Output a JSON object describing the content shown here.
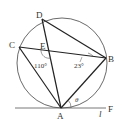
{
  "diagram": {
    "colors": {
      "stroke": "#222222",
      "text": "#333333",
      "background": "#ffffff"
    },
    "points": {
      "A": {
        "label": "A",
        "x": 61,
        "y": 108
      },
      "B": {
        "label": "B",
        "x": 106,
        "y": 58
      },
      "C": {
        "label": "C",
        "x": 19,
        "y": 47
      },
      "D": {
        "label": "D",
        "x": 42,
        "y": 19
      },
      "E": {
        "label": "E",
        "x": 49,
        "y": 51
      },
      "F": {
        "label": "F",
        "x": 108,
        "y": 108
      }
    },
    "line_label": "l",
    "angles": {
      "angle_E": "110°",
      "angle_B": "23°",
      "theta": "θ"
    },
    "segments": [
      "A-D",
      "A-C",
      "A-B",
      "C-B",
      "D-B",
      "tangent-l"
    ]
  }
}
